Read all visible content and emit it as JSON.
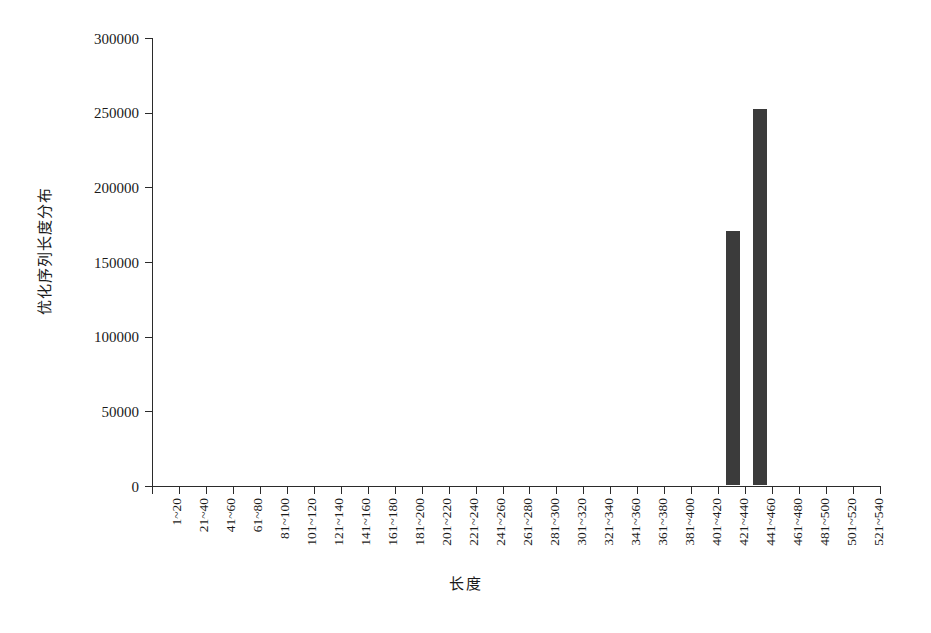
{
  "chart_data": {
    "type": "bar",
    "title": "",
    "xlabel": "长度",
    "ylabel": "优化序列长度分布",
    "categories": [
      "1~20",
      "21~40",
      "41~60",
      "61~80",
      "81~100",
      "101~120",
      "121~140",
      "141~160",
      "161~180",
      "181~200",
      "201~220",
      "221~240",
      "241~260",
      "261~280",
      "281~300",
      "301~320",
      "321~340",
      "341~360",
      "361~380",
      "381~400",
      "401~420",
      "421~440",
      "441~460",
      "461~480",
      "481~500",
      "501~520",
      "521~540"
    ],
    "values": [
      0,
      0,
      0,
      0,
      0,
      0,
      0,
      0,
      0,
      0,
      0,
      0,
      0,
      0,
      0,
      0,
      0,
      0,
      0,
      0,
      0,
      170000,
      252000,
      0,
      0,
      0,
      0
    ],
    "ylim": [
      0,
      300000
    ],
    "yticks": [
      0,
      50000,
      100000,
      150000,
      200000,
      250000,
      300000
    ],
    "ytick_labels": [
      "0",
      "50000",
      "100000",
      "150000",
      "200000",
      "250000",
      "300000"
    ],
    "grid": false,
    "legend": null,
    "bar_color": "#3b3b3b",
    "axis_color": "#2b2b2b",
    "background_color": "#ffffff"
  }
}
